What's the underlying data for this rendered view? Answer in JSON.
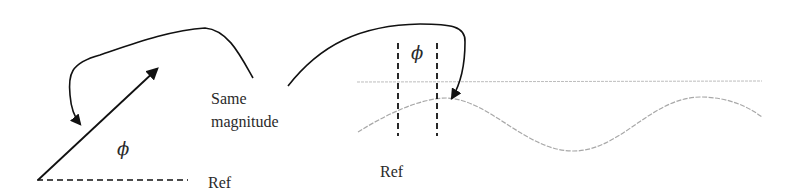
{
  "diagram": {
    "title": "",
    "phasor_panel": {
      "angle_label": "ϕ",
      "reference_label": "Ref"
    },
    "annotation": {
      "line1": "Same",
      "line2": "magnitude"
    },
    "waveform_panel": {
      "phase_shift_label": "ϕ",
      "reference_label": "Ref"
    },
    "colors": {
      "ink": "#111111",
      "waveform": "#a8a8a8",
      "axis": "#bdbdbd",
      "text": "#2a2a2a"
    }
  }
}
